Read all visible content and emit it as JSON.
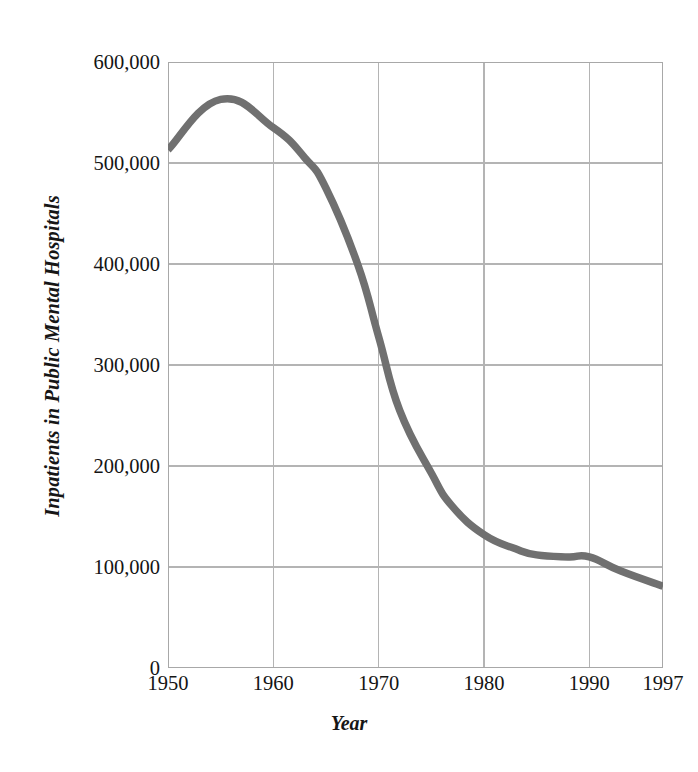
{
  "chart_data": {
    "type": "line",
    "title": "",
    "xlabel": "Year",
    "ylabel": "Inpatients in Public Mental Hospitals",
    "xlim": [
      1950,
      1997
    ],
    "ylim": [
      0,
      600000
    ],
    "grid": true,
    "legend": null,
    "x_tick_labels": [
      "1950",
      "1960",
      "1970",
      "1980",
      "1990",
      "1997"
    ],
    "x_ticks": [
      1950,
      1960,
      1970,
      1980,
      1990,
      1997
    ],
    "y_tick_labels": [
      "600,000",
      "500,000",
      "400,000",
      "300,000",
      "200,000",
      "100,000",
      "0"
    ],
    "y_ticks": [
      600000,
      500000,
      400000,
      300000,
      200000,
      100000,
      0
    ],
    "line_color": "#707070",
    "grid_color": "#b4b4b4",
    "x": [
      1950,
      1955,
      1960,
      1963,
      1965,
      1968,
      1970,
      1972,
      1975,
      1977,
      1980,
      1983,
      1985,
      1988,
      1990,
      1993,
      1997
    ],
    "values": [
      513000,
      563000,
      535000,
      505000,
      475000,
      400000,
      328000,
      255000,
      193000,
      160000,
      132000,
      118000,
      112000,
      110000,
      110000,
      96000,
      81000
    ],
    "series": [
      {
        "name": "Inpatients in Public Mental Hospitals",
        "values": [
          513000,
          563000,
          535000,
          505000,
          475000,
          400000,
          328000,
          255000,
          193000,
          160000,
          132000,
          118000,
          112000,
          110000,
          110000,
          96000,
          81000
        ]
      }
    ]
  },
  "axes": {
    "y_title": "Inpatients in Public Mental Hospitals",
    "x_title": "Year",
    "y_labels": [
      "600,000",
      "500,000",
      "400,000",
      "300,000",
      "200,000",
      "100,000",
      "0"
    ],
    "x_labels": [
      "1950",
      "1960",
      "1970",
      "1980",
      "1990",
      "1997"
    ]
  }
}
